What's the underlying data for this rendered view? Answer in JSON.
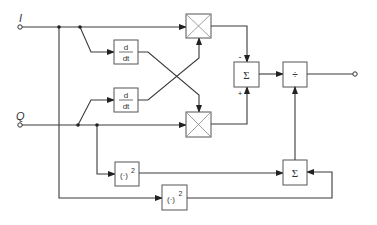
{
  "diagram": {
    "inputs": {
      "i": {
        "label": "I"
      },
      "q": {
        "label": "Q"
      }
    },
    "blocks": {
      "deriv_i": {
        "num": "d",
        "den": "dt"
      },
      "deriv_q": {
        "num": "d",
        "den": "dt"
      },
      "mult_1": {
        "symbol": "multiplier"
      },
      "mult_2": {
        "symbol": "multiplier"
      },
      "sum_1": {
        "label": "Σ",
        "minus": "-",
        "plus": "+"
      },
      "divide": {
        "label": "÷"
      },
      "square_q": {
        "base": "(·)",
        "exp": "2"
      },
      "square_i": {
        "base": "(·)",
        "exp": "2"
      },
      "sum_2": {
        "label": "Σ"
      }
    },
    "colors": {
      "line": "#3a3a3a",
      "box_border": "#555555",
      "background": "#ffffff"
    }
  }
}
